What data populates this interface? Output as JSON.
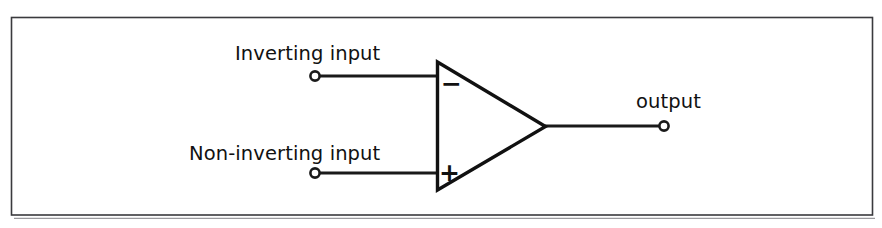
{
  "figure": {
    "background_color": "#ffffff",
    "line_color": "#1a1a1a",
    "frame_color": "#3a3a3e",
    "width": 882,
    "height": 228
  },
  "labels": {
    "inverting_input": "Inverting input",
    "non_inverting_input": "Non-inverting input",
    "output": "output"
  },
  "polarity": {
    "minus": "−",
    "plus": "+"
  },
  "terminals": [
    {
      "name": "inverting-input-terminal",
      "x": 315,
      "y": 76
    },
    {
      "name": "non-inverting-input-terminal",
      "x": 315,
      "y": 173
    },
    {
      "name": "output-terminal",
      "x": 664,
      "y": 126
    }
  ],
  "amplifier": {
    "shape": "triangle",
    "left_edge_x": 437,
    "top_y": 62,
    "bottom_y": 190,
    "apex_x": 545,
    "apex_y": 126
  },
  "frame": {
    "left": 11,
    "top": 17,
    "right": 873,
    "bottom": 215
  }
}
